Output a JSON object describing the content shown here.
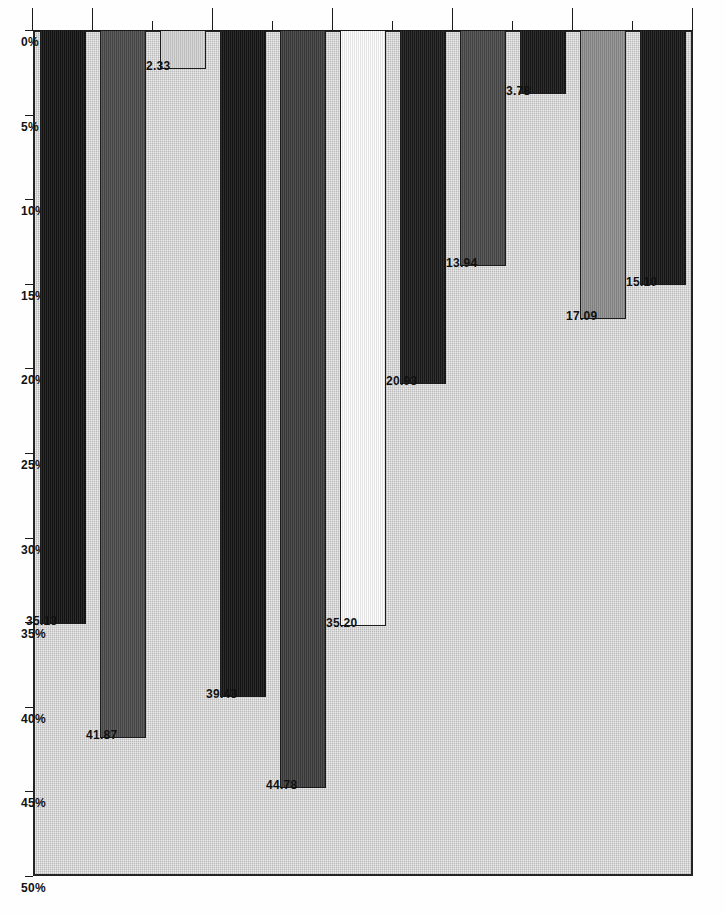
{
  "chart_data": {
    "type": "bar",
    "orientation": "horizontal-rotated",
    "title": "",
    "xlabel": "",
    "ylabel": "",
    "categories": [
      "Administration",
      "Law\nenforcement",
      "Ecclesiastic\nservice",
      "Education",
      "Health (excluding\nmidwives)",
      "Scientific societies\nand associations",
      "Art and\nliterature",
      "Other\nprofessions",
      "Agriculture",
      "Mining, industry,\ntransportation",
      "Commerce, banking\ntransportation"
    ],
    "values": [
      15.1,
      17.09,
      3.78,
      13.94,
      20.93,
      35.2,
      44.78,
      39.43,
      2.33,
      41.87,
      35.13
    ],
    "value_labels": [
      "15.10",
      "17.09",
      "3.78",
      "13.94",
      "20.93",
      "35.20",
      "44.78",
      "39.43",
      "2.33",
      "41.87",
      "35.13"
    ],
    "bar_colors": [
      "#161616",
      "#8e8e8e",
      "#171717",
      "#4a4a4a",
      "#1a1a1a",
      "#fdfdfd",
      "#3d3d3d",
      "#141414",
      "#d3d3d3",
      "#4c4c4c",
      "#131313"
    ],
    "ylim": [
      0,
      50
    ],
    "tick_labels": [
      "50%",
      "45%",
      "40%",
      "35%",
      "30%",
      "25%",
      "20%",
      "15%",
      "10%",
      "5%",
      "0%"
    ],
    "tick_values": [
      50,
      45,
      40,
      35,
      30,
      25,
      20,
      15,
      10,
      5,
      0
    ],
    "grid": false,
    "legend": "none",
    "plot_background": "#cfcfcf",
    "axis_color": "#1b1b1b"
  }
}
